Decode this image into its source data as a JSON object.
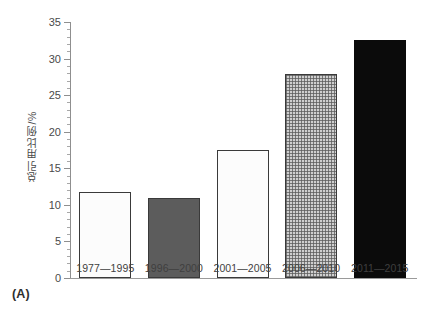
{
  "panel": {
    "label": "(A)"
  },
  "chart_data": {
    "type": "bar",
    "title": "",
    "xlabel": "",
    "ylabel": "总引用比例/%",
    "categories": [
      "1977—1995",
      "1996—2000",
      "2001—2005",
      "2006—2010",
      "2011—2015"
    ],
    "values": [
      11.8,
      10.9,
      17.5,
      27.9,
      32.6
    ],
    "series": [
      {
        "name": "总引用比例",
        "values": [
          11.8,
          10.9,
          17.5,
          27.9,
          32.6
        ]
      }
    ],
    "bar_styles": [
      "white",
      "dark-gray",
      "white",
      "gray-crosshatch",
      "black"
    ],
    "ylim": [
      0,
      35
    ],
    "ytick_labels": [
      "0",
      "5",
      "10",
      "15",
      "20",
      "25",
      "30",
      "35"
    ],
    "ytick_values": [
      0,
      5,
      10,
      15,
      20,
      25,
      30,
      35
    ],
    "ytick_minor_step": 1,
    "grid": false,
    "legend": false,
    "legend_position": "none"
  },
  "colors": {
    "bar_white": "#fcfcfc",
    "bar_dark_gray": "#5c5c5c",
    "bar_black": "#0b0b0b",
    "bar_crosshatch": "#cfcfcf",
    "bar_outline": "#3a3a3a",
    "axis": "#8f8f8f",
    "text": "#3f3f3f",
    "background": "#ffffff"
  }
}
